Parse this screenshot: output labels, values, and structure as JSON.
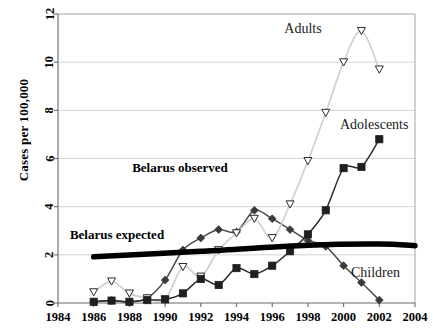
{
  "figure": {
    "ylabel": "Cases per 100,000",
    "xlabel": "",
    "title": ""
  },
  "annotations": {
    "adults": "Adults",
    "adolescents": "Adolescents",
    "children": "Children",
    "belarus_observed": "Belarus observed",
    "belarus_expected": "Belarus expected"
  },
  "axes": {
    "x_ticks": [
      "1984",
      "1986",
      "1988",
      "1990",
      "1992",
      "1994",
      "1996",
      "1998",
      "2000",
      "2002",
      "2004"
    ],
    "y_ticks": [
      "0",
      "2",
      "4",
      "6",
      "8",
      "10",
      "12"
    ],
    "xlim": [
      1984,
      2004
    ],
    "ylim": [
      0,
      12
    ]
  },
  "chart_data": {
    "type": "line",
    "title": "",
    "xlabel": "",
    "ylabel": "Cases per 100,000",
    "xlim": [
      1984,
      2004
    ],
    "ylim": [
      0,
      12
    ],
    "grid": true,
    "legend": "annotated-inline",
    "x": [
      1986,
      1987,
      1988,
      1989,
      1990,
      1991,
      1992,
      1993,
      1994,
      1995,
      1996,
      1997,
      1998,
      1999,
      2000,
      2001,
      2002
    ],
    "series": [
      {
        "name": "Adults",
        "marker": "triangle-down-open",
        "color": "#d0d0d0",
        "values": [
          0.45,
          0.9,
          0.4,
          0.2,
          0.15,
          1.5,
          1.1,
          2.2,
          2.9,
          3.5,
          2.7,
          4.1,
          5.9,
          7.9,
          10.0,
          11.3,
          9.7
        ]
      },
      {
        "name": "Adolescents",
        "marker": "square-filled",
        "color": "#2b2b2b",
        "values": [
          0.05,
          0.1,
          0.05,
          0.12,
          0.15,
          0.4,
          1.0,
          0.75,
          1.45,
          1.2,
          1.55,
          2.15,
          2.85,
          3.85,
          5.6,
          5.65,
          6.8
        ]
      },
      {
        "name": "Children",
        "marker": "diamond-filled",
        "color": "#4a4a4a",
        "values": [
          0.05,
          0.1,
          0.05,
          0.2,
          0.95,
          2.2,
          2.7,
          3.05,
          2.95,
          3.85,
          3.5,
          3.05,
          2.6,
          2.35,
          1.55,
          0.85,
          0.12
        ]
      }
    ],
    "reference_line": {
      "name": "Belarus expected",
      "style": "thick-black-curve",
      "x": [
        1986,
        1992,
        1998,
        2002,
        2004
      ],
      "values": [
        1.92,
        2.15,
        2.4,
        2.45,
        2.38
      ]
    }
  }
}
